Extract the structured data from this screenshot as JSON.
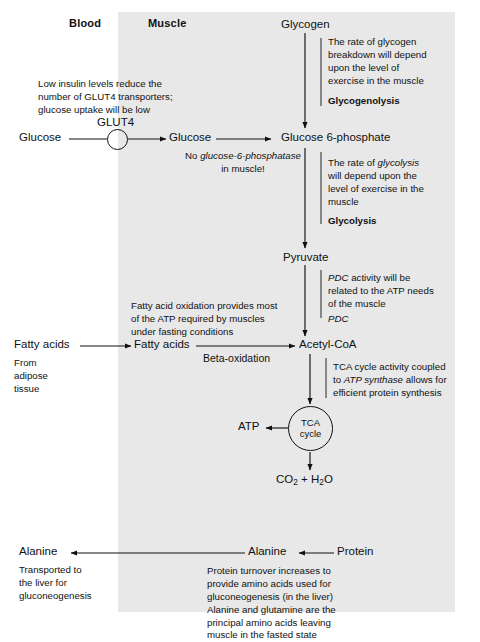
{
  "diagram": {
    "headers": {
      "blood": "Blood",
      "muscle": "Muscle"
    },
    "colors": {
      "panel_background": "#e8e8e8",
      "page_background": "#ffffff",
      "ink": "#111111"
    },
    "nodes": {
      "glycogen": "Glycogen",
      "glucose_blood": "Glucose",
      "glucose_muscle": "Glucose",
      "glucose_6_phosphate": "Glucose 6-phosphate",
      "pyruvate": "Pyruvate",
      "fatty_acids_blood": "Fatty acids",
      "fatty_acids_muscle": "Fatty acids",
      "acetyl_coa": "Acetyl-CoA",
      "atp": "ATP",
      "co2_h2o": "CO2 + H2O",
      "alanine_blood": "Alanine",
      "alanine_muscle": "Alanine",
      "protein": "Protein",
      "tca_cycle": "TCA\ncycle",
      "glut4": "GLUT4"
    },
    "enzymes": {
      "glycogenolysis": "Glycogenolysis",
      "glycolysis": "Glycolysis",
      "pdc": "PDC",
      "beta_oxidation": "Beta-oxidation"
    },
    "notes": {
      "insulin": "Low insulin levels reduce the\nnumber of GLUT4 transporters;\nglucose uptake will be low",
      "glycogen_breakdown": "The rate of glycogen\nbreakdown will depend\nupon the level of\nexercise in the muscle",
      "no_g6pase_line1_prefix": "No ",
      "no_g6pase_italic": "glucose-6-phosphatase",
      "no_g6pase_line2": "in muscle!",
      "glycolysis_rate_prefix": "The rate of ",
      "glycolysis_rate_italic": "glycolysis",
      "glycolysis_rate_rest": "\nwill depend upon the\nlevel of exercise in the\nmuscle",
      "pdc_activity_italic": "PDC",
      "pdc_activity_rest": " activity will be\nrelated to the ATP needs\nof the muscle",
      "fatty_acid_oxidation": "Fatty acid oxidation provides most\nof the ATP required by muscles\nunder fasting conditions",
      "from_adipose": "From\nadipose\ntissue",
      "tca_coupled_prefix": "TCA cycle activity coupled\nto ",
      "tca_coupled_italic": "ATP synthase",
      "tca_coupled_rest": " allows for\nefficient protein synthesis",
      "transported_liver": "Transported to\nthe liver for\ngluconeogenesis",
      "protein_turnover": "Protein turnover increases to\nprovide amino acids used for\ngluconeogenesis (in the liver)\nAlanine and glutamine are the\nprincipal amino acids leaving\nmuscle in the fasted state"
    }
  }
}
